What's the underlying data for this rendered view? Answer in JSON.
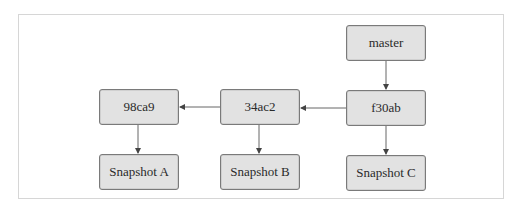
{
  "diagram": {
    "type": "git-commit-graph",
    "nodes": {
      "master": {
        "label": "master",
        "kind": "branch-pointer"
      },
      "f30ab": {
        "label": "f30ab",
        "kind": "commit"
      },
      "c34ac2": {
        "label": "34ac2",
        "kind": "commit"
      },
      "c98ca9": {
        "label": "98ca9",
        "kind": "commit"
      },
      "snapA": {
        "label": "Snapshot A",
        "kind": "snapshot"
      },
      "snapB": {
        "label": "Snapshot B",
        "kind": "snapshot"
      },
      "snapC": {
        "label": "Snapshot C",
        "kind": "snapshot"
      }
    },
    "edges": [
      {
        "from": "master",
        "to": "f30ab"
      },
      {
        "from": "f30ab",
        "to": "34ac2"
      },
      {
        "from": "34ac2",
        "to": "98ca9"
      },
      {
        "from": "98ca9",
        "to": "Snapshot A"
      },
      {
        "from": "34ac2",
        "to": "Snapshot B"
      },
      {
        "from": "f30ab",
        "to": "Snapshot C"
      }
    ],
    "colors": {
      "node_fill": "#e2e2e2",
      "node_border": "#7a7a7a",
      "edge": "#555555",
      "frame_border": "#d6d6d6"
    }
  }
}
